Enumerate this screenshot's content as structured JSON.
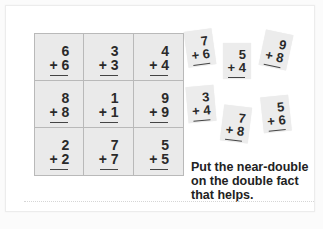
{
  "worksheet": {
    "grid_title": "Double facts",
    "double_facts": [
      {
        "top": "6",
        "bottom": "+ 6"
      },
      {
        "top": "3",
        "bottom": "+ 3"
      },
      {
        "top": "4",
        "bottom": "+ 4"
      },
      {
        "top": "8",
        "bottom": "+ 8"
      },
      {
        "top": "1",
        "bottom": "+ 1"
      },
      {
        "top": "9",
        "bottom": "+ 9"
      },
      {
        "top": "2",
        "bottom": "+ 2"
      },
      {
        "top": "7",
        "bottom": "+ 7"
      },
      {
        "top": "5",
        "bottom": "+ 5"
      }
    ],
    "near_double_cards": [
      {
        "top": "7",
        "bottom": "+ 6",
        "rotation_deg": -8
      },
      {
        "top": "5",
        "bottom": "+ 4",
        "rotation_deg": 0
      },
      {
        "top": "9",
        "bottom": "+ 8",
        "rotation_deg": 12
      },
      {
        "top": "3",
        "bottom": "+ 4",
        "rotation_deg": -5
      },
      {
        "top": "7",
        "bottom": "+ 8",
        "rotation_deg": 7
      },
      {
        "top": "5",
        "bottom": "+ 6",
        "rotation_deg": -6
      }
    ],
    "instruction": "Put the near-double on the double fact that helps."
  },
  "colors": {
    "cell_background": "#eaeaea",
    "grid_line": "#b9b9b9",
    "text": "#222222",
    "panel": "#ffffff"
  }
}
